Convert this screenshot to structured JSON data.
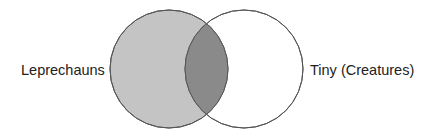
{
  "diagram": {
    "type": "venn",
    "sets": [
      {
        "label": "Leprechauns",
        "fill": "#c4c4c4"
      },
      {
        "label": "Tiny (Creatures)",
        "fill": "#ffffff"
      }
    ],
    "intersection": {
      "fill": "#8a8a8a"
    },
    "stroke": "#555555"
  }
}
